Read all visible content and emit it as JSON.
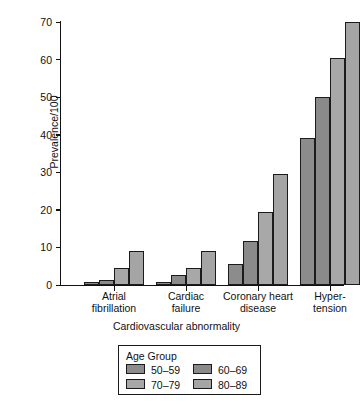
{
  "chart_data": {
    "type": "bar",
    "title": "",
    "subtitle": "",
    "xlabel": "Cardiovascular abnormality",
    "ylabel": "Prevalence/100",
    "ylim": [
      0,
      70
    ],
    "yticks": [
      0,
      10,
      20,
      30,
      40,
      50,
      60,
      70
    ],
    "ytick_labels": [
      "0",
      "10",
      "20",
      "30",
      "40",
      "50",
      "60",
      "70"
    ],
    "grid": false,
    "legend_position": "below-plot",
    "legend_title": "Age Group",
    "categories": [
      "Atrial fibrillation",
      "Cardiac failure",
      "Coronary heart disease",
      "Hypertension"
    ],
    "category_label_lines": [
      [
        "Atrial",
        "fibrillation"
      ],
      [
        "Cardiac",
        "failure"
      ],
      [
        "Coronary heart",
        "disease"
      ],
      [
        "Hyper-",
        "tension"
      ]
    ],
    "series": [
      {
        "name": "50-59",
        "label": "50–59",
        "color": "#8c8c8c",
        "values": [
          0.7,
          0.7,
          5.5,
          39.0
        ]
      },
      {
        "name": "60-69",
        "label": "60–69",
        "color": "#8a8a8a",
        "values": [
          1.4,
          2.6,
          11.8,
          50.0
        ]
      },
      {
        "name": "70-79",
        "label": "70–79",
        "color": "#a8a8a8",
        "values": [
          4.6,
          4.6,
          19.4,
          60.5
        ]
      },
      {
        "name": "80-89",
        "label": "80–89",
        "color": "#a5a5a5",
        "values": [
          9.1,
          9.0,
          29.5,
          70.0
        ]
      }
    ],
    "bar_edge_color": "#1b1b1b",
    "axis_color": "#111111",
    "background_color": "#ffffff"
  }
}
